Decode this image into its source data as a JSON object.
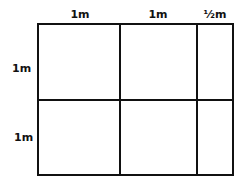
{
  "diagram": {
    "top_labels": [
      "1m",
      "1m",
      "½m"
    ],
    "left_labels": [
      "1m",
      "1m"
    ],
    "line_color": "#111111",
    "background": "#ffffff",
    "grid": {
      "columns": 3,
      "rows": 2,
      "column_widths_m": [
        1,
        1,
        0.5
      ],
      "row_heights_m": [
        1,
        1
      ]
    }
  }
}
